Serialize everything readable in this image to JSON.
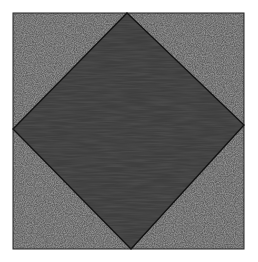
{
  "figure": {
    "outer_square": {
      "x": 13,
      "y": 13,
      "width": 231,
      "height": 236,
      "fill": "#5a5a5a",
      "texture": "noise"
    },
    "inner_diamond": {
      "points": [
        [
          127,
          13
        ],
        [
          244,
          125
        ],
        [
          131,
          249
        ],
        [
          13,
          129
        ]
      ],
      "fill": "#3f3f3f",
      "texture": "horizontal-streaks"
    },
    "stroke_color": "#111111",
    "background": "#ffffff"
  }
}
